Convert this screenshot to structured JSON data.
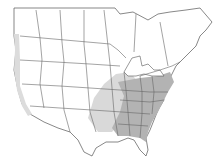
{
  "map": {
    "region": "North America (United States and southern Canada)",
    "type": "species range map",
    "legend": [],
    "colors": {
      "background": "#ffffff",
      "land": "#ffffff",
      "border": "#666666",
      "range_light": "#d9d9d9",
      "range_dark": "#b3b3b3",
      "coastal_fringe": "#dcdcdc"
    },
    "shaded_areas": [
      {
        "name": "eastern-core-range",
        "shade": "dark",
        "description": "Eastern and southeastern United States"
      },
      {
        "name": "plains-secondary-range",
        "shade": "light",
        "description": "Southern plains and Texas"
      },
      {
        "name": "pacific-coast-fringe",
        "shade": "light",
        "description": "Pacific coastline"
      }
    ]
  }
}
